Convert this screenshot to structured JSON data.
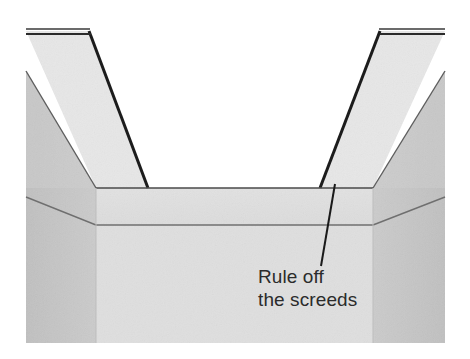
{
  "figure": {
    "caption_visible": false,
    "background_color": "#ffffff"
  },
  "annotation": {
    "name": "rule-off-the-screeds",
    "line1": "Rule off",
    "line2": "the screeds",
    "text_color": "#2b2b2b",
    "leader_line": {
      "from_x": 335,
      "from_y": 184,
      "to_x": 321,
      "to_y": 266,
      "color": "#1a1a1a",
      "width": 2
    },
    "text_x": 258,
    "line1_y": 283,
    "line2_y": 306
  },
  "colors": {
    "light_fill": "#e3e3e3",
    "mid_fill": "#dcdcdc",
    "floor_fill": "#dededf",
    "dark_side_fill": "#c3c3c3",
    "dark_side_fill_right": "#c5c5c5",
    "wall_face_fill": "#e6e6e6",
    "outline_dark": "#1c1c1c",
    "outline_mid": "#6f6f6f",
    "outline_light": "#8a8a8a",
    "white": "#ffffff"
  },
  "geometry": {
    "canvas": {
      "width": 470,
      "height": 359
    },
    "drawing_bounds": {
      "x": 26,
      "y": 25,
      "width": 419,
      "height": 318
    },
    "left_wall": {
      "top_outer_x": 26,
      "top_inner_x": 89,
      "top_y": 31,
      "base_outer_x": 96,
      "base_inner_x": 148,
      "base_y": 188
    },
    "right_wall": {
      "top_inner_x": 380,
      "top_outer_x": 445,
      "top_y": 31,
      "base_inner_x": 320,
      "base_outer_x": 373,
      "base_y": 188
    },
    "floor": {
      "left_x": 96,
      "right_x": 373,
      "top_y": 188,
      "bottom_y": 225,
      "base_bottom_y": 343
    },
    "side_panels": {
      "left_edge_x": 26,
      "left_inner_x": 96,
      "right_inner_x": 373,
      "right_edge_x": 445,
      "upper_diag_left_start_y": 71,
      "upper_diag_left_end_y": 188,
      "lower_diag_left_start_y": 197,
      "lower_diag_left_end_y": 225
    }
  },
  "elements": [
    {
      "name": "left-outer-wall-panel",
      "kind": "polygon",
      "shade": "dark"
    },
    {
      "name": "right-outer-wall-panel",
      "kind": "polygon",
      "shade": "dark"
    },
    {
      "name": "left-screed-rail",
      "kind": "polygon",
      "shade": "light"
    },
    {
      "name": "right-screed-rail",
      "kind": "polygon",
      "shade": "light"
    },
    {
      "name": "trench-floor",
      "kind": "polygon",
      "shade": "floor"
    },
    {
      "name": "trench-front-face",
      "kind": "polygon",
      "shade": "mid"
    }
  ]
}
